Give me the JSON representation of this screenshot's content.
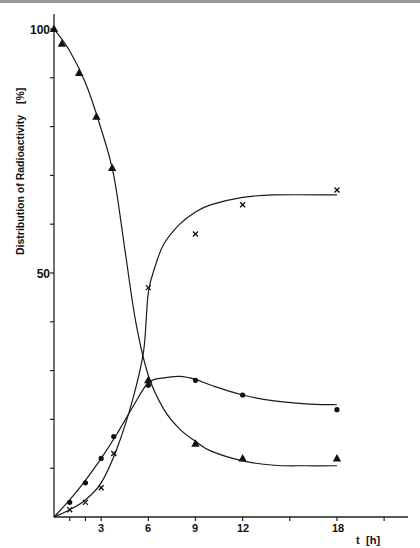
{
  "chart_data": {
    "type": "line",
    "title": "",
    "xlabel": "t [h]",
    "ylabel": "Distribution of Radioactivity [%]",
    "x_ticks_labeled": [
      "3",
      "6",
      "9",
      "12",
      "18"
    ],
    "x_tick_positions": [
      1,
      2,
      3,
      6,
      9,
      12,
      15,
      18,
      21
    ],
    "y_ticks_labeled": [
      "50",
      "100"
    ],
    "y_tick_positions": [
      10,
      20,
      30,
      40,
      50,
      60,
      70,
      80,
      90,
      100
    ],
    "xlim": [
      0,
      22
    ],
    "ylim": [
      0,
      105
    ],
    "grid": false,
    "legend": null,
    "series": [
      {
        "name": "triangles",
        "marker": "triangle",
        "points": [
          [
            0,
            100
          ],
          [
            0.5,
            97
          ],
          [
            1.6,
            91
          ],
          [
            2.7,
            82
          ],
          [
            3.7,
            71.5
          ],
          [
            6,
            28
          ],
          [
            9,
            15
          ],
          [
            12,
            12
          ],
          [
            18,
            12
          ]
        ],
        "curve": [
          [
            0,
            100
          ],
          [
            1,
            95.5
          ],
          [
            2,
            89
          ],
          [
            3,
            79.5
          ],
          [
            3.8,
            70
          ],
          [
            4.5,
            55
          ],
          [
            5.2,
            40
          ],
          [
            6,
            29
          ],
          [
            7,
            22
          ],
          [
            8,
            18
          ],
          [
            9,
            15.5
          ],
          [
            10,
            13.5
          ],
          [
            12,
            11.5
          ],
          [
            14,
            10.6
          ],
          [
            16,
            10.5
          ],
          [
            18,
            10.5
          ]
        ]
      },
      {
        "name": "crosses",
        "marker": "cross",
        "points": [
          [
            1,
            1.5
          ],
          [
            2,
            3
          ],
          [
            3,
            6
          ],
          [
            3.8,
            13
          ],
          [
            6,
            47
          ],
          [
            9,
            58
          ],
          [
            12,
            64
          ],
          [
            18,
            67
          ]
        ],
        "curve": [
          [
            0,
            0
          ],
          [
            1,
            1.5
          ],
          [
            2,
            3.5
          ],
          [
            3,
            7
          ],
          [
            4,
            14
          ],
          [
            5,
            24
          ],
          [
            5.7,
            34
          ],
          [
            6,
            46
          ],
          [
            6.5,
            52
          ],
          [
            7,
            56
          ],
          [
            8,
            60
          ],
          [
            9,
            62.5
          ],
          [
            10,
            64
          ],
          [
            12,
            65.5
          ],
          [
            14,
            66
          ],
          [
            18,
            66
          ]
        ]
      },
      {
        "name": "dots",
        "marker": "circle",
        "points": [
          [
            1,
            3
          ],
          [
            2,
            7
          ],
          [
            3,
            12
          ],
          [
            3.8,
            16.5
          ],
          [
            6,
            27
          ],
          [
            9,
            28
          ],
          [
            12,
            25
          ],
          [
            18,
            22
          ]
        ],
        "curve": [
          [
            0,
            0
          ],
          [
            1,
            3.5
          ],
          [
            2,
            7.5
          ],
          [
            3,
            12
          ],
          [
            4,
            17
          ],
          [
            5,
            22.5
          ],
          [
            6,
            27.5
          ],
          [
            7,
            28.5
          ],
          [
            8,
            28.8
          ],
          [
            9,
            28.2
          ],
          [
            10,
            27
          ],
          [
            12,
            25
          ],
          [
            14,
            23.8
          ],
          [
            16,
            23.2
          ],
          [
            18,
            23
          ]
        ]
      }
    ]
  },
  "axes": {
    "x_label_t": "t",
    "x_label_unit": "[h]",
    "y_label_text": "Distribution of Radioactivity",
    "y_label_unit": "[%]",
    "y_tick_100": "100",
    "y_tick_50": "50",
    "x_tick_3": "3",
    "x_tick_6": "6",
    "x_tick_9": "9",
    "x_tick_12": "12",
    "x_tick_18": "18"
  }
}
